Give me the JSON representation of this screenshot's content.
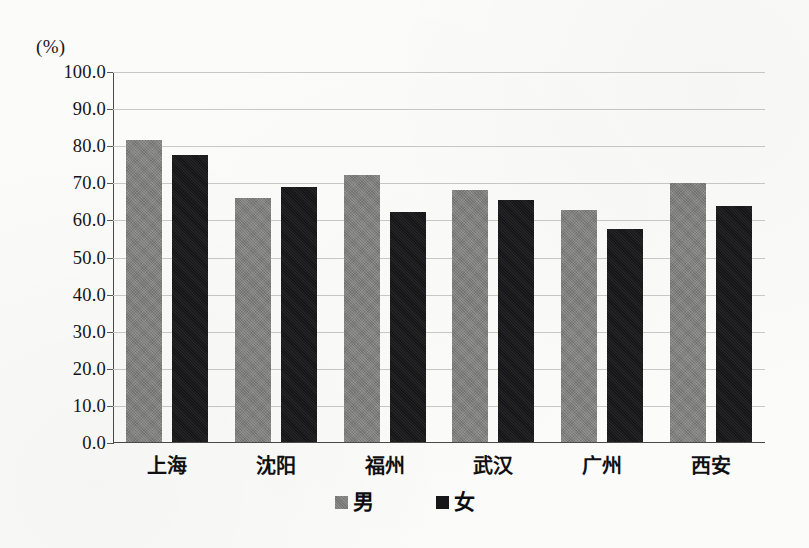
{
  "chart_data": {
    "type": "bar",
    "title": "",
    "subtitle": "",
    "xlabel": "",
    "ylabel": "(%)",
    "unit_label": "(%)",
    "ylim": [
      0.0,
      100.0
    ],
    "ytick_step": 10.0,
    "ytick_labels": [
      "100.0",
      "90.0",
      "80.0",
      "70.0",
      "60.0",
      "50.0",
      "40.0",
      "30.0",
      "20.0",
      "10.0",
      "0.0"
    ],
    "ytick_values": [
      100.0,
      90.0,
      80.0,
      70.0,
      60.0,
      50.0,
      40.0,
      30.0,
      20.0,
      10.0,
      0.0
    ],
    "grid": true,
    "grid_axis": "y",
    "legend_position": "bottom-center",
    "categories": [
      "上海",
      "沈阳",
      "福州",
      "武汉",
      "广州",
      "西安"
    ],
    "series": [
      {
        "name": "男",
        "color": "#7d7d7b",
        "values": [
          81.7,
          66.1,
          72.2,
          68.2,
          62.8,
          70.0
        ]
      },
      {
        "name": "女",
        "color": "#17171a",
        "values": [
          77.6,
          69.0,
          62.3,
          65.6,
          57.8,
          63.9
        ]
      }
    ]
  },
  "legend": {
    "items": [
      {
        "label": "男",
        "swatch": "male"
      },
      {
        "label": "女",
        "swatch": "female"
      }
    ]
  }
}
